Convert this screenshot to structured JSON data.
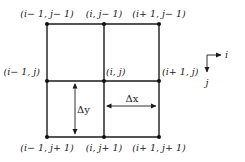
{
  "diagram": {
    "type": "finite-difference-grid",
    "nodes": [
      {
        "id": "tl",
        "label": "(i− 1, j− 1)",
        "x": 47,
        "y": 24
      },
      {
        "id": "tm",
        "label": "(i, j− 1)",
        "x": 104,
        "y": 24
      },
      {
        "id": "tr",
        "label": "(i+ 1, j− 1)",
        "x": 159,
        "y": 24
      },
      {
        "id": "ml",
        "label": "(i− 1, j)",
        "x": 47,
        "y": 81
      },
      {
        "id": "mm",
        "label": "(i, j)",
        "x": 104,
        "y": 81
      },
      {
        "id": "mr",
        "label": "(i+ 1, j)",
        "x": 159,
        "y": 81
      },
      {
        "id": "bl",
        "label": "(i− 1, j+ 1)",
        "x": 47,
        "y": 137
      },
      {
        "id": "bm",
        "label": "(i, j+ 1)",
        "x": 104,
        "y": 137
      },
      {
        "id": "br",
        "label": "(i+ 1, j+ 1)",
        "x": 159,
        "y": 137
      }
    ],
    "spacing": {
      "dy_label": "Δy",
      "dx_label": "Δx"
    },
    "axes": {
      "horizontal_label": "i",
      "vertical_label": "j"
    }
  }
}
